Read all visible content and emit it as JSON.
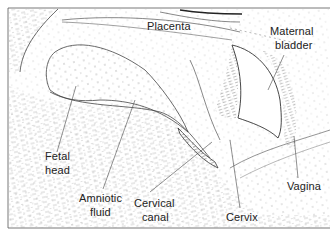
{
  "diagram": {
    "type": "anatomical-illustration",
    "labels": {
      "placenta": "Placenta",
      "maternal_bladder_l1": "Maternal",
      "maternal_bladder_l2": "bladder",
      "fetal_head_l1": "Fetal",
      "fetal_head_l2": "head",
      "amniotic_fluid_l1": "Amniotic",
      "amniotic_fluid_l2": "fluid",
      "cervical_canal_l1": "Cervical",
      "cervical_canal_l2": "canal",
      "cervix": "Cervix",
      "vagina": "Vagina"
    },
    "colors": {
      "ink": "#333333",
      "background": "#ffffff",
      "hatch": "#8a8a8a"
    }
  }
}
